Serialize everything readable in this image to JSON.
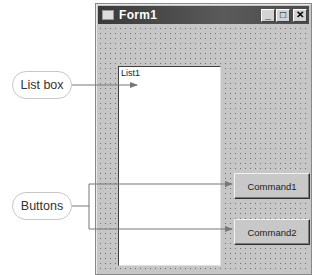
{
  "window": {
    "title": "Form1",
    "buttons": {
      "minimize": "_",
      "maximize": "□",
      "close": "✕"
    }
  },
  "listbox": {
    "label": "List1"
  },
  "commands": [
    {
      "label": "Command1"
    },
    {
      "label": "Command2"
    }
  ],
  "callouts": {
    "listbox": "List box",
    "buttons": "Buttons"
  },
  "colors": {
    "titlebar": "#4a4a4a",
    "form_bg": "#c6c6c6",
    "callout_line": "#777777"
  }
}
